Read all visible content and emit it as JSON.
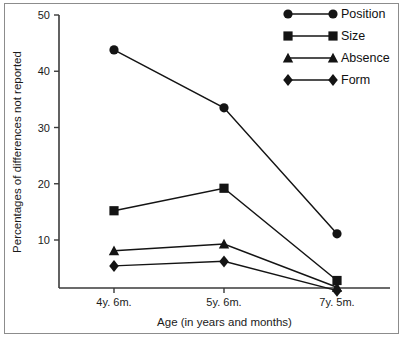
{
  "chart_data": {
    "type": "line",
    "title": "",
    "xlabel": "Age (in years and months)",
    "ylabel": "Percentages of differences not reported",
    "categories": [
      "4y. 6m.",
      "5y. 6m.",
      "7y. 5m."
    ],
    "ylim": [
      0,
      50
    ],
    "yticks": [
      10,
      20,
      30,
      40,
      50
    ],
    "ytick_labels": [
      "10",
      "20",
      "30",
      "40",
      "50"
    ],
    "grid": false,
    "legend_position": "top-right",
    "series": [
      {
        "name": "Position",
        "marker": "circle",
        "values": [
          43.8,
          33.5,
          11.1
        ]
      },
      {
        "name": "Size",
        "marker": "square",
        "values": [
          15.2,
          19.2,
          2.8
        ]
      },
      {
        "name": "Absence",
        "marker": "triangle",
        "values": [
          8.1,
          9.3,
          1.6
        ]
      },
      {
        "name": "Form",
        "marker": "diamond",
        "values": [
          5.4,
          6.2,
          1.0
        ]
      }
    ],
    "colors": {
      "series": "#141414",
      "axis": "#3a3a3a",
      "text": "#1a1a1a",
      "frame": "#8c8c8c",
      "background": "#ffffff"
    }
  }
}
